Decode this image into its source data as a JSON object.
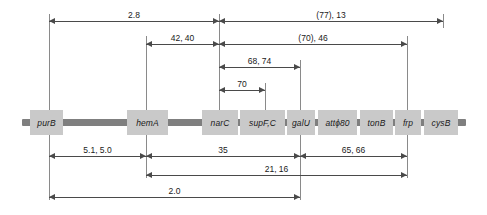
{
  "diagram": {
    "backbone_color": "#7f7f7f",
    "gene_box_color": "#c9c9c9",
    "line_color": "#4a4a4a"
  },
  "genes": [
    {
      "label": "purB",
      "x": 30,
      "w": 33
    },
    {
      "label": "hemA",
      "x": 127,
      "w": 41
    },
    {
      "label": "narC",
      "x": 202,
      "w": 36
    },
    {
      "label": "supF,C",
      "x": 240,
      "w": 45
    },
    {
      "label": "galU",
      "x": 287,
      "w": 28
    },
    {
      "label": "attϕ80",
      "x": 318,
      "w": 39
    },
    {
      "label": "tonB",
      "x": 360,
      "w": 33
    },
    {
      "label": "frp",
      "x": 395,
      "w": 26
    },
    {
      "label": "cysB",
      "x": 424,
      "w": 34
    }
  ],
  "leaders": [
    {
      "name": "purB",
      "x": 49,
      "top": 14,
      "bottom": 200
    },
    {
      "name": "hemA",
      "x": 146,
      "top": 36,
      "bottom": 178
    },
    {
      "name": "narC",
      "x": 219,
      "top": 14,
      "bottom": 113
    },
    {
      "name": "supF",
      "x": 265,
      "top": 83,
      "bottom": 113
    },
    {
      "name": "galU",
      "x": 300,
      "top": 60,
      "bottom": 200
    },
    {
      "name": "frp",
      "x": 407,
      "top": 36,
      "bottom": 178
    },
    {
      "name": "cysB",
      "x": 443,
      "top": 14,
      "bottom": 28
    }
  ],
  "dimensions": [
    {
      "id": "d-2-8",
      "label": "2.8",
      "y": 21,
      "x1": 49,
      "x2": 219,
      "arrows": "both"
    },
    {
      "id": "d-77-13",
      "label": "(77), 13",
      "y": 21,
      "x1": 219,
      "x2": 443,
      "arrows": "both"
    },
    {
      "id": "d-42-40",
      "label": "42, 40",
      "y": 44,
      "x1": 146,
      "x2": 219,
      "arrows": "both"
    },
    {
      "id": "d-70-46",
      "label": "(70), 46",
      "y": 44,
      "x1": 219,
      "x2": 407,
      "arrows": "both"
    },
    {
      "id": "d-68-74",
      "label": "68, 74",
      "y": 67,
      "x1": 219,
      "x2": 300,
      "arrows": "both"
    },
    {
      "id": "d-70",
      "label": "70",
      "y": 90,
      "x1": 219,
      "x2": 265,
      "arrows": "both"
    },
    {
      "id": "d-51-50",
      "label": "5.1, 5.0",
      "y": 156,
      "x1": 49,
      "x2": 146,
      "arrows": "both"
    },
    {
      "id": "d-35",
      "label": "35",
      "y": 156,
      "x1": 146,
      "x2": 300,
      "arrows": "both"
    },
    {
      "id": "d-65-66",
      "label": "65, 66",
      "y": 156,
      "x1": 300,
      "x2": 407,
      "arrows": "both"
    },
    {
      "id": "d-21-16",
      "label": "21, 16",
      "y": 175,
      "x1": 146,
      "x2": 407,
      "arrows": "both"
    },
    {
      "id": "d-2-0",
      "label": "2.0",
      "y": 197,
      "x1": 49,
      "x2": 300,
      "arrows": "both"
    }
  ],
  "backbone": {
    "x": 22,
    "y": 119,
    "w": 444
  }
}
